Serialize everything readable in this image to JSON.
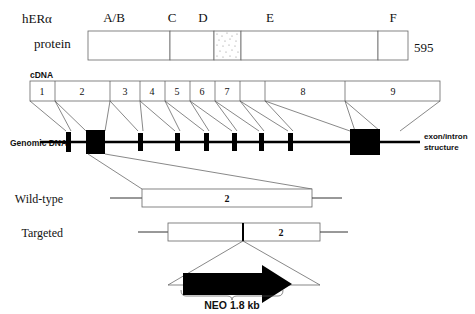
{
  "figure": {
    "title_gene": "hERα",
    "protein_row": {
      "label": "protein",
      "length_label": "595",
      "domains": [
        {
          "name": "A/B",
          "fill": "#ffffff",
          "x": 88,
          "w": 82
        },
        {
          "name": "C",
          "fill": "#e8e8e8",
          "x": 170,
          "w": 44
        },
        {
          "name": "D",
          "fill": "#f2f2f2",
          "x": 214,
          "w": 27
        },
        {
          "name": "E",
          "fill": "#ffffff",
          "x": 241,
          "w": 137
        },
        {
          "name": "F",
          "fill": "#7a7a7a",
          "x": 378,
          "w": 30
        }
      ]
    },
    "cdna_row": {
      "label": "cDNA",
      "exons": [
        "1",
        "2",
        "3",
        "4",
        "5",
        "6",
        "7",
        "8",
        "9"
      ],
      "exon_bounds": [
        30,
        55,
        110,
        140,
        165,
        190,
        215,
        240,
        265,
        345,
        440
      ]
    },
    "genomic_row": {
      "label": "Genomic DNA",
      "right_label_line1": "exon/intron",
      "right_label_line2": "structure",
      "blocks": [
        {
          "exon": "1",
          "x": 66,
          "w": 5,
          "h": 20
        },
        {
          "exon": "2",
          "x": 86,
          "w": 19,
          "h": 23
        },
        {
          "exon": "3",
          "x": 138,
          "w": 5,
          "h": 18
        },
        {
          "exon": "4",
          "x": 175,
          "w": 5,
          "h": 18
        },
        {
          "exon": "5",
          "x": 204,
          "w": 5,
          "h": 18
        },
        {
          "exon": "6",
          "x": 232,
          "w": 5,
          "h": 18
        },
        {
          "exon": "7",
          "x": 259,
          "w": 5,
          "h": 18
        },
        {
          "exon": "8",
          "x": 288,
          "w": 5,
          "h": 18
        },
        {
          "exon": "9",
          "x": 350,
          "w": 30,
          "h": 26
        }
      ]
    },
    "allele_rows": [
      {
        "label": "Wild-type",
        "exon_label": "2"
      },
      {
        "label": "Targeted",
        "exon_label": "2"
      }
    ],
    "cassette": {
      "label": "NEO 1.8 kb"
    }
  },
  "colors": {
    "ink": "#111111",
    "line": "#555555",
    "box_stroke": "#666666",
    "domain_c": "#e8e8e8",
    "domain_d": "#f2f2f2",
    "domain_f": "#7a7a7a",
    "black": "#000000"
  }
}
